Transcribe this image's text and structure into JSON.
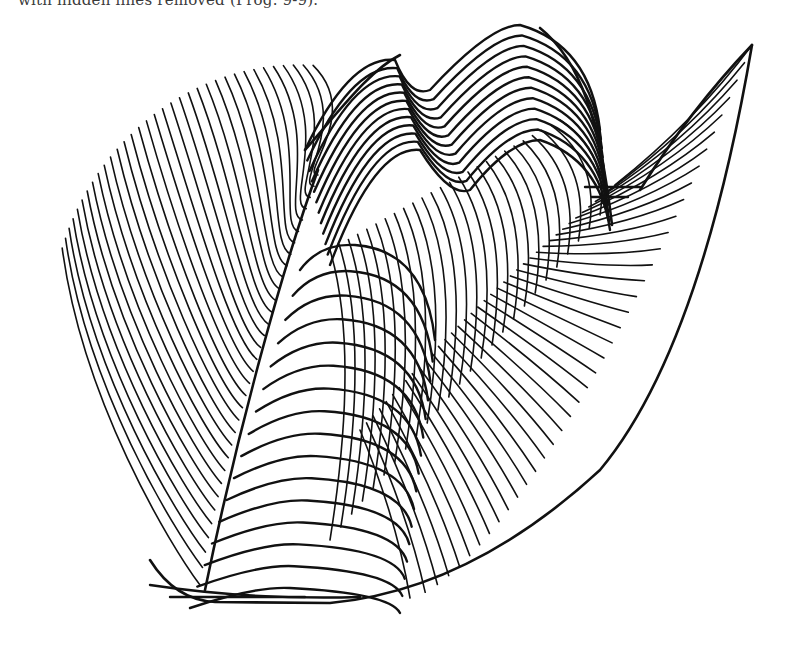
{
  "page": {
    "caption_fragment": "with hidden lines removed (Prog. 9-9).",
    "background": "#ffffff",
    "ink": "#111111"
  },
  "figure": {
    "type": "wireframe-surface",
    "bounds": {
      "left": 55,
      "top": 20,
      "right": 752,
      "bottom": 602
    },
    "back_fan": {
      "count": 34,
      "top_arc": {
        "cx": 300,
        "cy": 330,
        "rx": 250,
        "ry": 265
      }
    },
    "front_bands": {
      "count": 16,
      "crest_y": 245,
      "bottom_y": 598
    },
    "crest_curves": {
      "count": 12
    },
    "right_wing": {
      "count": 40,
      "tip": [
        752,
        45
      ],
      "base": [
        405,
        600
      ]
    }
  }
}
